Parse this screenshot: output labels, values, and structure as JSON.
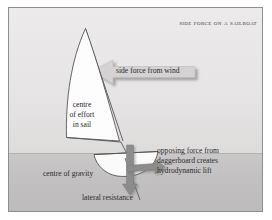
{
  "diagram": {
    "title": "Side force on a sailboat",
    "type": "physics-illustration",
    "subject": "sailboat",
    "frame": {
      "border_color": "#8e8e8e",
      "sky_color": "#eae8e8",
      "water_color": "#c4c2c2",
      "waterline_y": 146
    },
    "labels": [
      {
        "id": "title",
        "text": "Side force on a sailboat",
        "style": "small-caps"
      },
      {
        "id": "side-force-from-wind",
        "text": "side force from wind"
      },
      {
        "id": "centre-of-effort-in-sail",
        "lines": [
          "centre",
          "of effort",
          "in sail"
        ]
      },
      {
        "id": "centre-of-gravity",
        "text": "centre of gravity"
      },
      {
        "id": "opposing-force",
        "lines": [
          "opposing force from",
          "daggerboard creates",
          "hydrodynamic lift"
        ]
      },
      {
        "id": "lateral-resistance",
        "text": "lateral resistance"
      }
    ],
    "label_text": {
      "side_force": "side force from wind",
      "centre_effort_1": "centre",
      "centre_effort_2": "of effort",
      "centre_effort_3": "in sail",
      "centre_gravity": "centre of gravity",
      "opposing_1": "opposing force from",
      "opposing_2": "daggerboard creates",
      "opposing_3": "hydrodynamic lift",
      "lateral_resistance": "lateral resistance"
    },
    "parts": [
      {
        "name": "sail",
        "fill": "#ffffff",
        "stroke": "#555555"
      },
      {
        "name": "mast",
        "stroke": "#555555"
      },
      {
        "name": "hull",
        "fill": "#f6f6f6",
        "stroke": "#555555"
      },
      {
        "name": "daggerboard",
        "stroke": "#555555"
      },
      {
        "name": "wind-force-arrow",
        "direction": "left",
        "fill": "#d2d0d0"
      },
      {
        "name": "gravity-arrow",
        "direction": "down",
        "fill": "#8a8a8a"
      },
      {
        "name": "lift-arrow",
        "direction": "right",
        "fill": "#8a8a8a"
      }
    ],
    "colors": {
      "arrow_large": "#d2d0d0",
      "arrow_small": "#8a8a8a",
      "outline": "#555555",
      "text": "#2b2b2b"
    }
  }
}
